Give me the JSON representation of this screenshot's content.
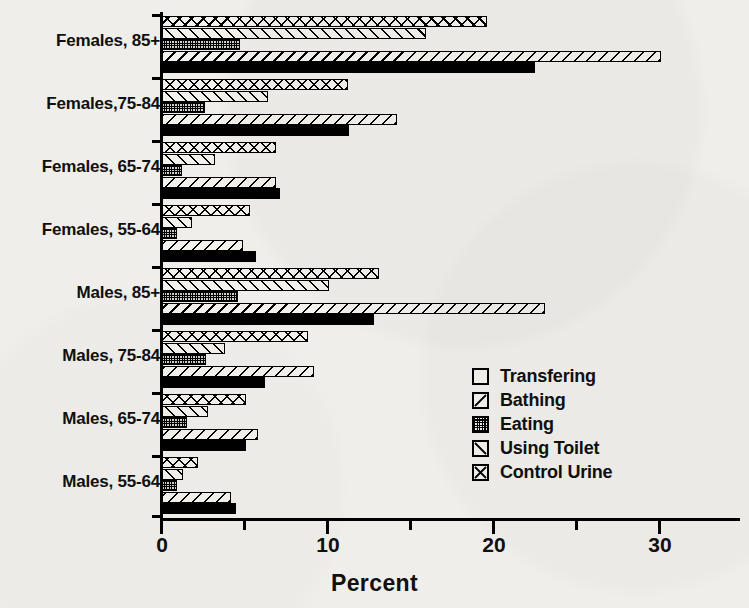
{
  "chart_data": {
    "type": "bar",
    "orientation": "horizontal",
    "title": "",
    "xlabel": "Percent",
    "ylabel": "",
    "xlim": [
      0,
      35
    ],
    "xticks": [
      0,
      10,
      20,
      30
    ],
    "xtick_labels": [
      "0",
      "10",
      "20",
      "30"
    ],
    "minor_xticks": [
      5,
      15,
      25
    ],
    "grid": false,
    "legend_position": "center-right",
    "categories": [
      "Females, 85+",
      "Females,75-84",
      "Females, 65-74",
      "Females, 55-64",
      "Males, 85+",
      "Males, 75-84",
      "Males, 65-74",
      "Males, 55-64"
    ],
    "series": [
      {
        "name": "Transfering",
        "pattern": "solid",
        "values": [
          22.6,
          11.4,
          7.2,
          5.8,
          12.9,
          6.3,
          5.2,
          4.6
        ]
      },
      {
        "name": "Bathing",
        "pattern": "bslash",
        "values": [
          30.2,
          14.3,
          7.0,
          5.0,
          23.2,
          9.3,
          5.9,
          4.3
        ]
      },
      {
        "name": "Eating",
        "pattern": "dots",
        "values": [
          4.8,
          2.7,
          1.3,
          1.0,
          4.7,
          2.8,
          1.6,
          1.0
        ]
      },
      {
        "name": "Using Toilet",
        "pattern": "fslash",
        "values": [
          16.0,
          6.5,
          3.3,
          1.9,
          10.2,
          3.9,
          2.9,
          1.4
        ]
      },
      {
        "name": "Control Urine",
        "pattern": "cross",
        "values": [
          19.7,
          11.3,
          7.0,
          5.4,
          13.2,
          8.9,
          5.2,
          2.3
        ]
      }
    ]
  },
  "axis": {
    "x_label": "Percent",
    "tick_0": "0",
    "tick_10": "10",
    "tick_20": "20",
    "tick_30": "30"
  },
  "categories": {
    "c0": "Females, 85+",
    "c1": "Females,75-84",
    "c2": "Females, 65-74",
    "c3": "Females, 55-64",
    "c4": "Males, 85+",
    "c5": "Males, 75-84",
    "c6": "Males, 65-74",
    "c7": "Males, 55-64"
  },
  "legend": {
    "items": [
      {
        "label": "Transfering",
        "icon": "solid-square-swatch"
      },
      {
        "label": "Bathing",
        "icon": "backslash-hatch-swatch"
      },
      {
        "label": "Eating",
        "icon": "stipple-swatch"
      },
      {
        "label": "Using Toilet",
        "icon": "forwardslash-hatch-swatch"
      },
      {
        "label": "Control Urine",
        "icon": "cross-hatch-swatch"
      }
    ]
  },
  "colors": {
    "ink": "#000000",
    "paper": "#efeeea",
    "bar_fill": "#f2f1ec"
  }
}
